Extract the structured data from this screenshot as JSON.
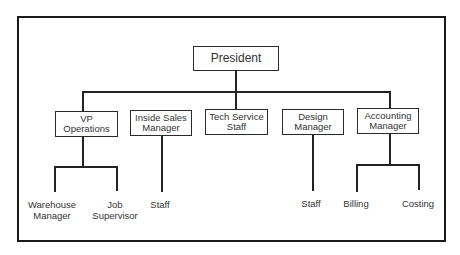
{
  "chart": {
    "root": "President",
    "departments": [
      {
        "line1": "VP",
        "line2": "Operations"
      },
      {
        "line1": "Inside Sales",
        "line2": "Manager"
      },
      {
        "line1": "Tech Service",
        "line2": "Staff"
      },
      {
        "line1": "Design",
        "line2": "Manager"
      },
      {
        "line1": "Accounting",
        "line2": "Manager"
      }
    ],
    "subordinates": {
      "vp_ops": [
        {
          "line1": "Warehouse",
          "line2": "Manager"
        },
        {
          "line1": "Job",
          "line2": "Supervisor"
        }
      ],
      "inside_sales": [
        {
          "line1": "Staff"
        }
      ],
      "design": [
        {
          "line1": "Staff"
        }
      ],
      "accounting": [
        {
          "line1": "Billing"
        },
        {
          "line1": "Costing"
        }
      ]
    }
  }
}
